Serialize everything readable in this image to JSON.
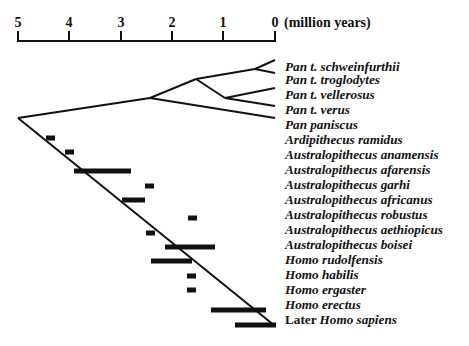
{
  "axis": {
    "unit_label": "(million years)",
    "ticks": [
      {
        "label": "5",
        "x": 18
      },
      {
        "label": "4",
        "x": 69
      },
      {
        "label": "3",
        "x": 121
      },
      {
        "label": "2",
        "x": 172
      },
      {
        "label": "1",
        "x": 223
      },
      {
        "label": "0",
        "x": 275
      }
    ]
  },
  "taxa": [
    {
      "prefix": "",
      "name": "Pan t. schweinfurthii",
      "y": 60
    },
    {
      "prefix": "",
      "name": "Pan t. troglodytes",
      "y": 73
    },
    {
      "prefix": "",
      "name": "Pan t. vellerosus",
      "y": 88
    },
    {
      "prefix": "",
      "name": "Pan t. verus",
      "y": 103
    },
    {
      "prefix": "",
      "name": "Pan paniscus",
      "y": 118
    },
    {
      "prefix": "",
      "name": "Ardipithecus ramidus",
      "y": 133
    },
    {
      "prefix": "",
      "name": "Australopithecus anamensis",
      "y": 148
    },
    {
      "prefix": "",
      "name": "Australopithecus afarensis",
      "y": 163
    },
    {
      "prefix": "",
      "name": "Australopithecus garhi",
      "y": 178
    },
    {
      "prefix": "",
      "name": "Australopithecus africanus",
      "y": 193
    },
    {
      "prefix": "",
      "name": "Australopithecus robustus",
      "y": 208
    },
    {
      "prefix": "",
      "name": "Australopithecus aethiopicus",
      "y": 223
    },
    {
      "prefix": "",
      "name": "Australopithecus boisei",
      "y": 238
    },
    {
      "prefix": "",
      "name": "Homo rudolfensis",
      "y": 253
    },
    {
      "prefix": "",
      "name": "Homo habilis",
      "y": 268
    },
    {
      "prefix": "",
      "name": "Homo ergaster",
      "y": 283
    },
    {
      "prefix": "",
      "name": "Homo erectus",
      "y": 298
    },
    {
      "prefix": "Later ",
      "name": "Homo sapiens",
      "y": 313
    }
  ],
  "tree_edges": [
    [
      18,
      118,
      150,
      98
    ],
    [
      150,
      98,
      196,
      79
    ],
    [
      196,
      79,
      255,
      69
    ],
    [
      255,
      69,
      275,
      60
    ],
    [
      255,
      69,
      275,
      73
    ],
    [
      196,
      79,
      225,
      98
    ],
    [
      225,
      98,
      275,
      88
    ],
    [
      225,
      98,
      275,
      106
    ],
    [
      150,
      98,
      275,
      118
    ],
    [
      18,
      118,
      275,
      326
    ]
  ],
  "fossil_ranges": [
    {
      "taxon": "Ardipithecus ramidus",
      "x1": 46,
      "x2": 55,
      "y": 138
    },
    {
      "taxon": "Australopithecus anamensis",
      "x1": 65,
      "x2": 74,
      "y": 152
    },
    {
      "taxon": "Australopithecus afarensis",
      "x1": 74,
      "x2": 131,
      "y": 171
    },
    {
      "taxon": "Australopithecus garhi",
      "x1": 145,
      "x2": 154,
      "y": 186
    },
    {
      "taxon": "Australopithecus africanus",
      "x1": 122,
      "x2": 145,
      "y": 200
    },
    {
      "taxon": "Australopithecus robustus",
      "x1": 188,
      "x2": 197,
      "y": 218
    },
    {
      "taxon": "Australopithecus aethiopicus",
      "x1": 146,
      "x2": 155,
      "y": 233
    },
    {
      "taxon": "Australopithecus boisei",
      "x1": 165,
      "x2": 215,
      "y": 247
    },
    {
      "taxon": "Homo rudolfensis",
      "x1": 151,
      "x2": 192,
      "y": 261
    },
    {
      "taxon": "Homo habilis",
      "x1": 187,
      "x2": 196,
      "y": 276
    },
    {
      "taxon": "Homo ergaster",
      "x1": 187,
      "x2": 196,
      "y": 290
    },
    {
      "taxon": "Homo erectus",
      "x1": 211,
      "x2": 266,
      "y": 310
    },
    {
      "taxon": "Later Homo sapiens",
      "x1": 235,
      "x2": 276,
      "y": 325
    }
  ]
}
